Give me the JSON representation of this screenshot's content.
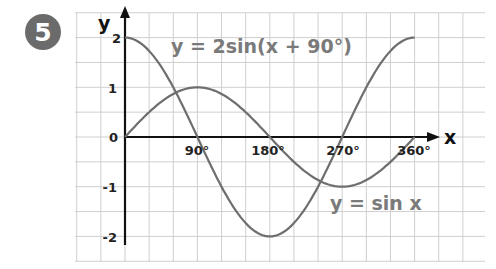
{
  "badge": {
    "number": "5",
    "color": "#6b6b6b"
  },
  "chart_data": {
    "type": "line",
    "title": "",
    "xlabel": "x",
    "ylabel": "y",
    "x_ticks": [
      "90°",
      "180°",
      "270°",
      "360°"
    ],
    "y_ticks": [
      "2",
      "1",
      "0",
      "-1",
      "-2"
    ],
    "xlim": [
      0,
      360
    ],
    "ylim": [
      -2,
      2
    ],
    "grid": true,
    "x": [
      0,
      45,
      90,
      135,
      180,
      225,
      270,
      315,
      360
    ],
    "series": [
      {
        "name": "y = sin x",
        "values": [
          0,
          0.71,
          1,
          0.71,
          0,
          -0.71,
          -1,
          -0.71,
          0
        ],
        "color": "#6e6e6e"
      },
      {
        "name": "y = 2sin(x + 90°)",
        "values": [
          2,
          1.41,
          0,
          -1.41,
          -2,
          -1.41,
          0,
          1.41,
          2
        ],
        "color": "#6e6e6e"
      }
    ],
    "annotations": [
      {
        "text": "y = 2sin(x + 90°)",
        "near": "top"
      },
      {
        "text": "y = sin x",
        "near": "bottom-right"
      }
    ]
  },
  "labels": {
    "y_axis": "y",
    "x_axis": "x",
    "eq_top": "y = 2sin(x + 90°)",
    "eq_bottom": "y = sin x",
    "xt0": "90°",
    "xt1": "180°",
    "xt2": "270°",
    "xt3": "360°",
    "yt2": "2",
    "yt1": "1",
    "yt0": "0",
    "ytm1": "-1",
    "ytm2": "-2"
  }
}
